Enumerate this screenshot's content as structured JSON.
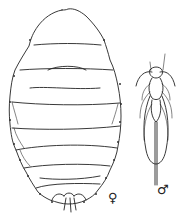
{
  "figure": {
    "labels": {
      "female": "♀",
      "male": "♂"
    },
    "colors": {
      "line": "#222222",
      "background": "#ffffff"
    }
  }
}
